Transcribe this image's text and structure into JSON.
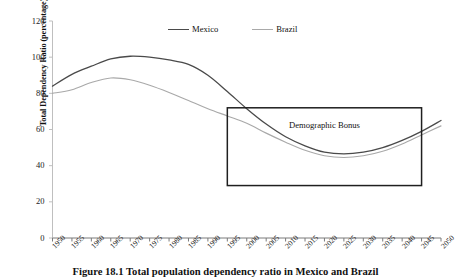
{
  "chart_data": {
    "type": "line",
    "title": "",
    "xlabel": "",
    "ylabel": "Total Dependency Ratio (percentage)",
    "ylim": [
      0,
      120
    ],
    "ytick_labels": [
      "0",
      "20",
      "40",
      "60",
      "80",
      "100",
      "120"
    ],
    "yticks": [
      0,
      20,
      40,
      60,
      80,
      100,
      120
    ],
    "xlim": [
      1950,
      2050
    ],
    "grid": false,
    "legend_position": "top-center",
    "x": [
      1950,
      1955,
      1960,
      1965,
      1970,
      1975,
      1980,
      1985,
      1990,
      1995,
      2000,
      2005,
      2010,
      2015,
      2020,
      2025,
      2030,
      2035,
      2040,
      2045,
      2050
    ],
    "xtick_labels": [
      "1950",
      "1955",
      "1960",
      "1965",
      "1970",
      "1975",
      "1980",
      "1985",
      "1990",
      "1995",
      "2000",
      "2005",
      "2010",
      "2015",
      "2020",
      "2025",
      "2030",
      "2035",
      "2040",
      "2045",
      "2050"
    ],
    "series": [
      {
        "name": "Mexico",
        "color": "#4a4a4a",
        "values": [
          84,
          90.5,
          95,
          99,
          100.5,
          100,
          98.5,
          96,
          90,
          81,
          71.5,
          63,
          56,
          51,
          47.5,
          46.5,
          47.5,
          50,
          54,
          59,
          65
        ]
      },
      {
        "name": "Brazil",
        "color": "#a9a9a9",
        "values": [
          80,
          82,
          86,
          88.5,
          87.5,
          84.5,
          80.5,
          76,
          71.5,
          67.5,
          63.5,
          58,
          53,
          48.5,
          45.5,
          44.5,
          45.5,
          48,
          52,
          57,
          62
        ]
      }
    ],
    "annotations": [
      {
        "label": "Demographic Bonus",
        "type": "box",
        "x_range": [
          1995,
          2045
        ],
        "y_range": [
          29,
          72
        ]
      }
    ]
  },
  "legend": {
    "items": [
      {
        "label": "Mexico",
        "color": "#4a4a4a"
      },
      {
        "label": "Brazil",
        "color": "#a9a9a9"
      }
    ]
  },
  "axes": {
    "y_axis_title": "Total Dependency Ratio (percentage)"
  },
  "caption": {
    "text": "Figure 18.1 Total population dependency ratio in Mexico and Brazil"
  }
}
